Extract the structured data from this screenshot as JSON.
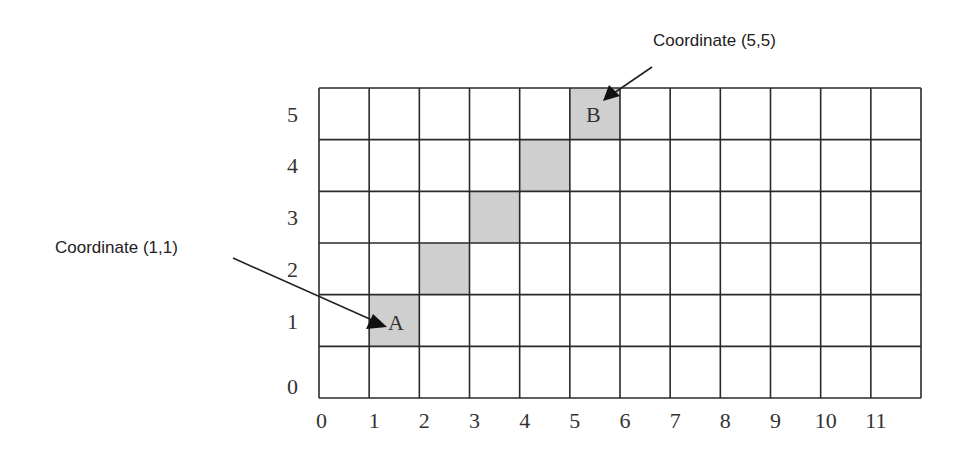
{
  "diagram": {
    "type": "coordinate-grid",
    "columns": 12,
    "rows": 6,
    "x_tick_labels": [
      "0",
      "1",
      "2",
      "3",
      "4",
      "5",
      "6",
      "7",
      "8",
      "9",
      "10",
      "11"
    ],
    "y_tick_labels": [
      "0",
      "1",
      "2",
      "3",
      "4",
      "5"
    ],
    "shaded_cells": [
      {
        "x": 1,
        "y": 1
      },
      {
        "x": 2,
        "y": 2
      },
      {
        "x": 3,
        "y": 3
      },
      {
        "x": 4,
        "y": 4
      },
      {
        "x": 5,
        "y": 5
      }
    ],
    "shade_color": "#cfcfcf",
    "line_color": "#2a2a2a",
    "points": [
      {
        "label": "A",
        "x": 1,
        "y": 1
      },
      {
        "label": "B",
        "x": 5,
        "y": 5
      }
    ],
    "annotations": [
      {
        "text": "Coordinate (1,1)",
        "target": "A"
      },
      {
        "text": "Coordinate (5,5)",
        "target": "B"
      }
    ]
  }
}
